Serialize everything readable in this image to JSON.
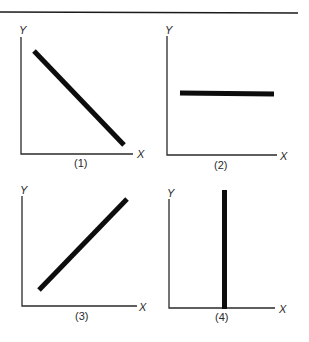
{
  "figure": {
    "panels": [
      {
        "id": "1",
        "caption": "(1)",
        "x_label": "X",
        "y_label": "Y",
        "relationship": "negative linear (downward sloping)"
      },
      {
        "id": "2",
        "caption": "(2)",
        "x_label": "X",
        "y_label": "Y",
        "relationship": "horizontal (Y constant)"
      },
      {
        "id": "3",
        "caption": "(3)",
        "x_label": "X",
        "y_label": "Y",
        "relationship": "positive linear (upward sloping)"
      },
      {
        "id": "4",
        "caption": "(4)",
        "x_label": "X",
        "y_label": "Y",
        "relationship": "vertical (X constant)"
      }
    ]
  },
  "colors": {
    "line": "#0d0d0d",
    "axis": "#2a2a2a",
    "background": "#ffffff"
  }
}
